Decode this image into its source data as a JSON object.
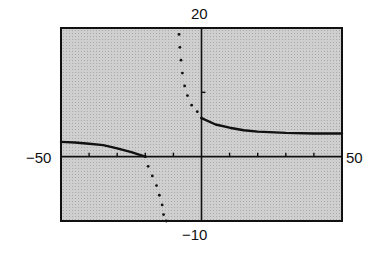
{
  "chart_data": {
    "type": "line",
    "title": "",
    "xlabel": "",
    "ylabel": "",
    "window": {
      "xmin": -50,
      "xmax": 50,
      "ymin": -10,
      "ymax": 20,
      "xscl": 10,
      "yscl": 10
    },
    "labels": {
      "ymax": "20",
      "ymin": "−10",
      "xmin": "−50",
      "xmax": "50"
    },
    "grid": false,
    "background": "#c8c8c8",
    "series": [
      {
        "name": "left-branch",
        "style": "solid",
        "points": [
          [
            -50,
            2.3
          ],
          [
            -45,
            2.2
          ],
          [
            -40,
            2.0
          ],
          [
            -35,
            1.8
          ],
          [
            -30,
            1.3
          ],
          [
            -25,
            0.7
          ],
          [
            -20,
            0
          ]
        ]
      },
      {
        "name": "lower-asymptote-branch",
        "style": "dotted",
        "points": [
          [
            -20,
            0
          ],
          [
            -19,
            -1.5
          ],
          [
            -17.5,
            -3
          ],
          [
            -16,
            -4.5
          ],
          [
            -15,
            -6
          ],
          [
            -14,
            -7.5
          ],
          [
            -13.5,
            -9
          ],
          [
            -12.5,
            -10
          ]
        ]
      },
      {
        "name": "upper-asymptote-branch",
        "style": "dotted",
        "points": [
          [
            -8,
            19
          ],
          [
            -7.7,
            17
          ],
          [
            -7.3,
            15
          ],
          [
            -6.8,
            13
          ],
          [
            -6,
            11
          ],
          [
            -5,
            9.5
          ],
          [
            -3.5,
            8
          ],
          [
            -1.5,
            7
          ],
          [
            0,
            6
          ]
        ]
      },
      {
        "name": "right-branch",
        "style": "solid",
        "points": [
          [
            0,
            6
          ],
          [
            5,
            5
          ],
          [
            10,
            4.5
          ],
          [
            15,
            4.1
          ],
          [
            20,
            3.9
          ],
          [
            30,
            3.7
          ],
          [
            40,
            3.6
          ],
          [
            50,
            3.6
          ]
        ]
      }
    ]
  }
}
